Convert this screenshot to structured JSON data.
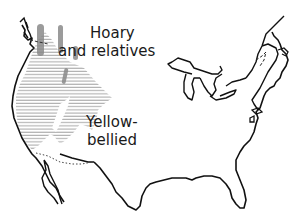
{
  "map": {
    "region": "United States",
    "style": "black-and-white line map",
    "colors": {
      "outline": "#111111",
      "hatch": "#9a9a9a",
      "stipple": "#888888",
      "background": "#ffffff"
    },
    "legend_labels": {
      "hoary": {
        "line1": "Hoary",
        "line2": "and relatives"
      },
      "yellow_bellied": {
        "line1": "Yellow-",
        "line2": "bellied"
      }
    },
    "ranges": [
      {
        "name": "Hoary and relatives",
        "pattern": "dark vertical stipple bands (northwest mountains)"
      },
      {
        "name": "Yellow-bellied",
        "pattern": "horizontal line hatching (western interior)"
      }
    ],
    "boundaries": [
      {
        "name": "US-Mexico border (dotted section)",
        "style": "dotted"
      },
      {
        "name": "US-Canada border (Maine, dashed)",
        "style": "dashed"
      }
    ]
  }
}
